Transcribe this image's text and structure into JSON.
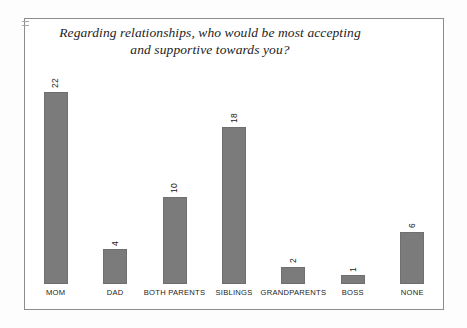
{
  "chart_data": {
    "type": "bar",
    "title": "Regarding relationships, who would be most accepting and supportive towards you?",
    "title_line1": "Regarding relationships, who would be most accepting",
    "title_line2": "and supportive towards you?",
    "categories": [
      "MOM",
      "DAD",
      "BOTH PARENTS",
      "SIBLINGS",
      "GRANDPARENTS",
      "BOSS",
      "NONE"
    ],
    "values": [
      22,
      4,
      10,
      18,
      2,
      1,
      6
    ],
    "value_labels": [
      "22",
      "4",
      "10",
      "18",
      "2",
      "1",
      "6"
    ],
    "xlabel": "",
    "ylabel": "",
    "ylim": [
      0,
      24
    ],
    "grid": false,
    "legend": false,
    "axis_lines": false,
    "value_label_rotation_deg": 90,
    "bar_color": "#7b7b7b",
    "bar_border_color": "#6f6f6f",
    "frame_color": "#8c8c8c",
    "background_color": "#ffffff",
    "text_color": "#1d1d1d"
  }
}
